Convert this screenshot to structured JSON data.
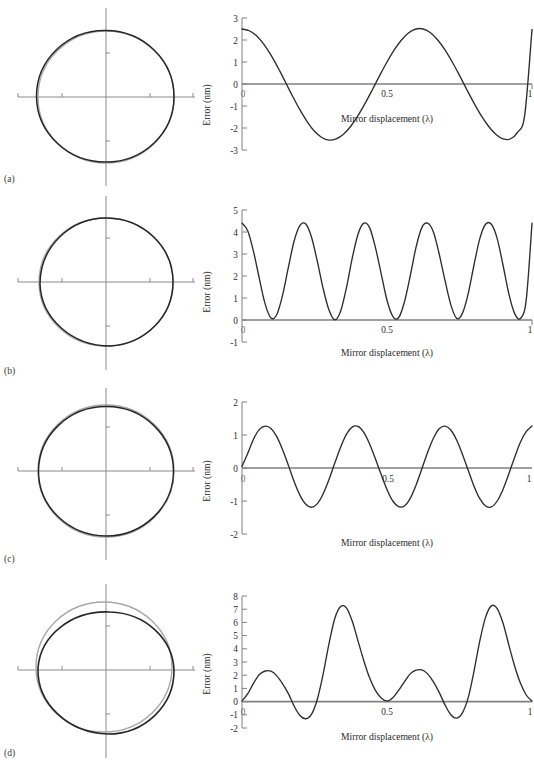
{
  "figure": {
    "panels": [
      {
        "id": "a",
        "label": "(a)",
        "lissajous": {
          "name": "lissajous-circle-a",
          "distortion": "slight-radial-offset"
        },
        "chart_data": {
          "type": "line",
          "title": "",
          "xlabel": "Mirror displacement (λ)",
          "ylabel": "Error (nm)",
          "xlim": [
            0,
            1
          ],
          "ylim": [
            -3,
            3
          ],
          "xticks": [
            0,
            0.5,
            1
          ],
          "xticklabels": [
            "0",
            "0.5",
            "1"
          ],
          "yticks": [
            -3,
            -2,
            -1,
            0,
            1,
            2,
            3
          ],
          "yticklabels": [
            "-3",
            "-2",
            "-1",
            "0",
            "1",
            "2",
            "3"
          ],
          "grid": false,
          "legend": "none",
          "series": [
            {
              "name": "Error",
              "x": [
                0,
                0.025,
                0.05,
                0.075,
                0.1,
                0.125,
                0.15,
                0.175,
                0.2,
                0.225,
                0.25,
                0.275,
                0.3,
                0.325,
                0.35,
                0.375,
                0.4,
                0.425,
                0.45,
                0.475,
                0.5,
                0.525,
                0.55,
                0.575,
                0.6,
                0.625,
                0.65,
                0.675,
                0.7,
                0.725,
                0.75,
                0.775,
                0.8,
                0.825,
                0.85,
                0.875,
                0.9,
                0.925,
                0.95,
                0.975,
                1
              ],
              "values": [
                2.5,
                2.42,
                2.19,
                1.81,
                1.31,
                0.72,
                0.08,
                -0.57,
                -1.18,
                -1.72,
                -2.15,
                -2.43,
                -2.55,
                -2.49,
                -2.28,
                -1.92,
                -1.44,
                -0.87,
                -0.25,
                0.39,
                1,
                1.55,
                2,
                2.33,
                2.5,
                2.5,
                2.33,
                2,
                1.55,
                1,
                0.39,
                -0.25,
                -0.87,
                -1.44,
                -1.92,
                -2.28,
                -2.49,
                -2.5,
                -2.2,
                -1.4,
                2.48
              ]
            }
          ],
          "description": "single-frequency sinusoid, amplitude 2.5 nm, two cycles over one wavelength"
        }
      },
      {
        "id": "b",
        "label": "(b)",
        "lissajous": {
          "name": "lissajous-circle-b",
          "distortion": "flattened-lower-left"
        },
        "chart_data": {
          "type": "line",
          "title": "",
          "xlabel": "Mirror displacement (λ)",
          "ylabel": "Error (nm)",
          "xlim": [
            0,
            1
          ],
          "ylim": [
            -1,
            5
          ],
          "xticks": [
            0,
            0.5,
            1
          ],
          "xticklabels": [
            "0",
            "0.5",
            "1"
          ],
          "yticks": [
            -1,
            0,
            1,
            2,
            3,
            4,
            5
          ],
          "yticklabels": [
            "-1",
            "0",
            "1",
            "2",
            "3",
            "4",
            "5"
          ],
          "grid": false,
          "legend": "none",
          "series": [
            {
              "name": "Error",
              "x": [
                0,
                0.02,
                0.04,
                0.06,
                0.08,
                0.1,
                0.12,
                0.14,
                0.16,
                0.18,
                0.2,
                0.22,
                0.24,
                0.26,
                0.28,
                0.3,
                0.32,
                0.34,
                0.36,
                0.38,
                0.4,
                0.42,
                0.44,
                0.46,
                0.48,
                0.5,
                0.52,
                0.54,
                0.56,
                0.58,
                0.6,
                0.62,
                0.64,
                0.66,
                0.68,
                0.7,
                0.72,
                0.74,
                0.76,
                0.78,
                0.8,
                0.82,
                0.84,
                0.86,
                0.88,
                0.9,
                0.92,
                0.94,
                0.96,
                0.98,
                1
              ],
              "values": [
                4.4,
                4.05,
                3.1,
                1.87,
                0.72,
                0.09,
                0.25,
                1.13,
                2.4,
                3.6,
                4.3,
                4.36,
                3.75,
                2.65,
                1.42,
                0.45,
                0.01,
                0.4,
                1.46,
                2.8,
                3.9,
                4.4,
                4.2,
                3.3,
                2.1,
                0.9,
                0.17,
                0.1,
                0.82,
                2,
                3.3,
                4.2,
                4.4,
                4,
                3,
                1.8,
                0.7,
                0.08,
                0.3,
                1.2,
                2.5,
                3.7,
                4.35,
                4.35,
                3.7,
                2.5,
                1.2,
                0.3,
                0.07,
                0.9,
                4.4
              ]
            }
          ],
          "description": "rectified double-frequency error, peaks 4.4 nm, minima touching zero, four cycles"
        }
      },
      {
        "id": "c",
        "label": "(c)",
        "lissajous": {
          "name": "lissajous-circle-c",
          "distortion": "near-circular"
        },
        "chart_data": {
          "type": "line",
          "title": "",
          "xlabel": "Mirror displacement (λ)",
          "ylabel": "Error (nm)",
          "xlim": [
            0,
            1
          ],
          "ylim": [
            -2,
            2
          ],
          "xticks": [
            0,
            0.5,
            1
          ],
          "xticklabels": [
            "0",
            "0.5",
            "1"
          ],
          "yticks": [
            -2,
            -1,
            0,
            1,
            2
          ],
          "yticklabels": [
            "-2",
            "-1",
            "0",
            "1",
            "2"
          ],
          "grid": false,
          "legend": "none",
          "series": [
            {
              "name": "Error",
              "x": [
                0,
                0.02,
                0.04,
                0.06,
                0.08,
                0.1,
                0.12,
                0.14,
                0.16,
                0.18,
                0.2,
                0.22,
                0.24,
                0.26,
                0.28,
                0.3,
                0.32,
                0.34,
                0.36,
                0.38,
                0.4,
                0.42,
                0.44,
                0.46,
                0.48,
                0.5,
                0.52,
                0.54,
                0.56,
                0.58,
                0.6,
                0.62,
                0.64,
                0.66,
                0.68,
                0.7,
                0.72,
                0.74,
                0.76,
                0.78,
                0.8,
                0.82,
                0.84,
                0.86,
                0.88,
                0.9,
                0.92,
                0.94,
                0.96,
                0.98,
                1
              ],
              "values": [
                0.05,
                0.45,
                0.88,
                1.17,
                1.27,
                1.2,
                0.95,
                0.55,
                0.08,
                -0.42,
                -0.83,
                -1.1,
                -1.19,
                -1.08,
                -0.78,
                -0.35,
                0.15,
                0.63,
                1.02,
                1.24,
                1.26,
                1.08,
                0.73,
                0.28,
                -0.2,
                -0.65,
                -1,
                -1.17,
                -1.15,
                -0.92,
                -0.52,
                -0.03,
                0.47,
                0.9,
                1.19,
                1.27,
                1.15,
                0.85,
                0.42,
                -0.07,
                -0.55,
                -0.93,
                -1.15,
                -1.18,
                -1,
                -0.65,
                -0.18,
                0.32,
                0.78,
                1.1,
                1.27
              ]
            }
          ],
          "description": "low amplitude sinusoid, about 1.25 nm peak, four cycles per wavelength"
        }
      },
      {
        "id": "d",
        "label": "(d)",
        "lissajous": {
          "name": "lissajous-circle-d",
          "distortion": "strong-offset-ellipse"
        },
        "chart_data": {
          "type": "line",
          "title": "",
          "xlabel": "Mirror displacement (λ)",
          "ylabel": "Error (nm)",
          "xlim": [
            0,
            1
          ],
          "ylim": [
            -2,
            8
          ],
          "xticks": [
            0,
            0.5,
            1
          ],
          "xticklabels": [
            "0",
            "0.5",
            "1"
          ],
          "yticks": [
            -2,
            -1,
            0,
            1,
            2,
            3,
            4,
            5,
            6,
            7,
            8
          ],
          "yticklabels": [
            "-2",
            "-1",
            "0",
            "1",
            "2",
            "3",
            "4",
            "5",
            "6",
            "7",
            "8"
          ],
          "grid": false,
          "legend": "none",
          "series": [
            {
              "name": "Error",
              "x": [
                0,
                0.02,
                0.04,
                0.06,
                0.08,
                0.1,
                0.12,
                0.14,
                0.16,
                0.18,
                0.2,
                0.22,
                0.24,
                0.26,
                0.28,
                0.3,
                0.32,
                0.34,
                0.36,
                0.38,
                0.4,
                0.42,
                0.44,
                0.46,
                0.48,
                0.5,
                0.52,
                0.54,
                0.56,
                0.58,
                0.6,
                0.62,
                0.64,
                0.66,
                0.68,
                0.7,
                0.72,
                0.74,
                0.76,
                0.78,
                0.8,
                0.82,
                0.84,
                0.86,
                0.88,
                0.9,
                0.92,
                0.94,
                0.96,
                0.98,
                1
              ],
              "values": [
                0.05,
                0.6,
                1.4,
                2.05,
                2.32,
                2.3,
                1.95,
                1.35,
                0.6,
                -0.35,
                -1.05,
                -1.3,
                -0.95,
                0.2,
                2.1,
                4.4,
                6.3,
                7.2,
                7.1,
                6.1,
                4.6,
                3.1,
                1.8,
                0.85,
                0.28,
                0.05,
                0.3,
                0.85,
                1.5,
                2.1,
                2.38,
                2.4,
                2.1,
                1.5,
                0.7,
                -0.25,
                -1,
                -1.25,
                -0.85,
                0.3,
                2.3,
                4.6,
                6.4,
                7.25,
                7.05,
                5.95,
                4.3,
                2.7,
                1.4,
                0.5,
                0.05
              ]
            }
          ],
          "description": "mixed harmonic error with alternating large 7.2 nm and small 2.4 nm peaks"
        }
      }
    ],
    "colors": {
      "axis": "#808080",
      "curve": "#2d2d2d",
      "reference_circle": "#9a9a9a",
      "measured_circle": "#262626",
      "text": "#2b2b2b"
    }
  }
}
